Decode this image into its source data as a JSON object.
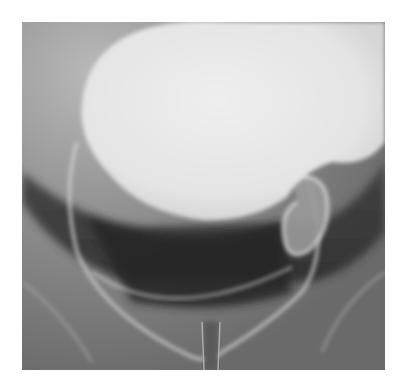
{
  "figure": {
    "kind": "grayscale radiograph",
    "colors": {
      "background": "#ffffff",
      "soft_tissue": "#7e7e7e",
      "contrast_bright": "#e8e8e8",
      "dark_gas_band": "#2e2e2e",
      "outline": "#d8d8d8"
    }
  }
}
